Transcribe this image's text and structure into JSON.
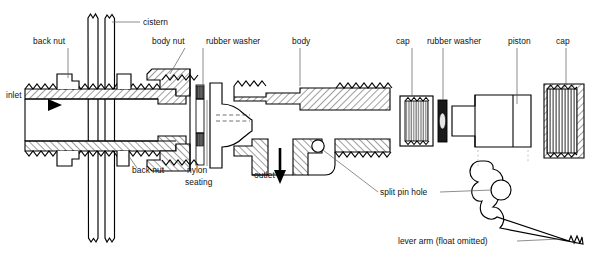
{
  "figure": {
    "kind": "technical-line-diagram",
    "background_color": "#ffffff",
    "ink_color": "#000000",
    "leader_color": "#5d5d5d"
  },
  "labels": [
    {
      "id": "cistern",
      "text": "cistern",
      "x": 143,
      "y": 25,
      "anchor": "start"
    },
    {
      "id": "back-nut-top",
      "text": "back nut",
      "x": 33,
      "y": 44,
      "anchor": "start"
    },
    {
      "id": "body-nut",
      "text": "body nut",
      "x": 152,
      "y": 44,
      "anchor": "start"
    },
    {
      "id": "rubber-washer-1",
      "text": "rubber washer",
      "x": 206,
      "y": 44,
      "anchor": "start"
    },
    {
      "id": "body",
      "text": "body",
      "x": 292,
      "y": 44,
      "anchor": "start"
    },
    {
      "id": "cap-1",
      "text": "cap",
      "x": 396,
      "y": 44,
      "anchor": "start"
    },
    {
      "id": "rubber-washer-2",
      "text": "rubber washer",
      "x": 427,
      "y": 44,
      "anchor": "start"
    },
    {
      "id": "piston",
      "text": "piston",
      "x": 508,
      "y": 44,
      "anchor": "start"
    },
    {
      "id": "cap-2",
      "text": "cap",
      "x": 556,
      "y": 44,
      "anchor": "start"
    },
    {
      "id": "inlet",
      "text": "inlet",
      "x": 6,
      "y": 98,
      "anchor": "start"
    },
    {
      "id": "back-nut-bottom",
      "text": "back nut",
      "x": 132,
      "y": 173,
      "anchor": "start"
    },
    {
      "id": "nylon",
      "text": "nylon",
      "x": 187,
      "y": 173,
      "anchor": "start"
    },
    {
      "id": "seating",
      "text": "seating",
      "x": 185,
      "y": 185,
      "anchor": "start"
    },
    {
      "id": "outlet",
      "text": "outlet",
      "x": 254,
      "y": 178,
      "anchor": "start"
    },
    {
      "id": "split-pin-hole",
      "text": "split pin hole",
      "x": 380,
      "y": 195,
      "anchor": "start"
    },
    {
      "id": "lever-arm",
      "text": "lever arm (float omitted)",
      "x": 398,
      "y": 244,
      "anchor": "start"
    }
  ],
  "parts": [
    {
      "id": "cistern-wall",
      "name": "cistern wall (partial section)"
    },
    {
      "id": "tail-pipe",
      "name": "threaded tail / inlet pipe"
    },
    {
      "id": "back-nut-upper",
      "name": "back nut (upper)"
    },
    {
      "id": "back-nut-lower",
      "name": "back nut (lower)"
    },
    {
      "id": "body-nut-part",
      "name": "body nut"
    },
    {
      "id": "washer-1",
      "name": "rubber washer (inlet side)"
    },
    {
      "id": "nylon-seating",
      "name": "nylon seating"
    },
    {
      "id": "valve-body",
      "name": "valve body"
    },
    {
      "id": "cap-left",
      "name": "cap (left)"
    },
    {
      "id": "washer-2",
      "name": "rubber washer (piston)"
    },
    {
      "id": "piston-part",
      "name": "piston"
    },
    {
      "id": "cap-right",
      "name": "cap (right)"
    },
    {
      "id": "lever-arm-part",
      "name": "lever arm (float omitted)"
    }
  ],
  "flow_arrows": [
    {
      "id": "inlet-arrow",
      "direction": "right",
      "label_ref": "inlet"
    },
    {
      "id": "outlet-arrow",
      "direction": "down",
      "label_ref": "outlet"
    }
  ]
}
